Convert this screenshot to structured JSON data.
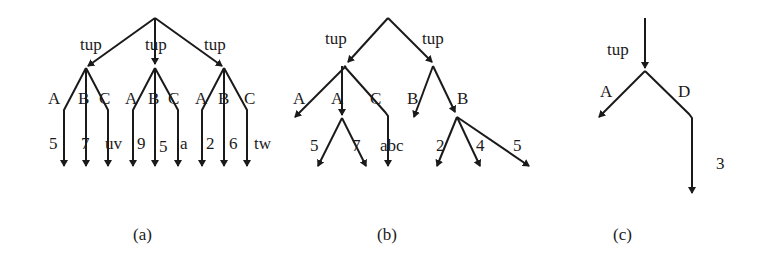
{
  "diagrams": [
    {
      "caption": "(a)",
      "edge_label_root": "tup",
      "tup_labels": [
        "tup",
        "tup",
        "tup"
      ],
      "groups": [
        {
          "attrs": [
            "A",
            "B",
            "C"
          ],
          "values": [
            "5",
            "7",
            "uv"
          ]
        },
        {
          "attrs": [
            "A",
            "B",
            "C"
          ],
          "values": [
            "9",
            "5",
            "a"
          ]
        },
        {
          "attrs": [
            "A",
            "B",
            "C"
          ],
          "values": [
            "2",
            "6",
            "tw"
          ]
        }
      ]
    },
    {
      "caption": "(b)",
      "tup_labels": [
        "tup",
        "tup"
      ],
      "left": {
        "attrs": [
          "A",
          "A",
          "C"
        ],
        "a_values": [
          "5",
          "7"
        ],
        "c_value": "abc"
      },
      "right": {
        "attrs": [
          "B",
          "B"
        ],
        "b_values": [
          "2",
          "4",
          "5"
        ]
      }
    },
    {
      "caption": "(c)",
      "tup_label": "tup",
      "attrs": [
        "A",
        "D"
      ],
      "d_value": "3"
    }
  ]
}
